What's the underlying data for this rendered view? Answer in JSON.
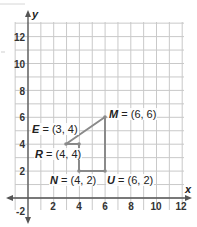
{
  "chart_data": {
    "type": "scatter",
    "title": "",
    "xlabel": "x",
    "ylabel": "y",
    "xlim": [
      -1,
      12.5
    ],
    "ylim": [
      -2.5,
      13
    ],
    "grid": true,
    "x_ticks": [
      "2",
      "4",
      "6",
      "8",
      "10",
      "12"
    ],
    "y_ticks": [
      "12",
      "10",
      "8",
      "6",
      "4",
      "2",
      "-2"
    ],
    "points": [
      {
        "name": "E",
        "x": 3,
        "y": 4,
        "label": "E = (3, 4)"
      },
      {
        "name": "M",
        "x": 6,
        "y": 6,
        "label": "M = (6, 6)"
      },
      {
        "name": "U",
        "x": 6,
        "y": 2,
        "label": "U = (6, 2)"
      },
      {
        "name": "N",
        "x": 4,
        "y": 2,
        "label": "N = (4, 2)"
      },
      {
        "name": "R",
        "x": 4,
        "y": 4,
        "label": "R = (4, 4)"
      }
    ],
    "polygon_order": [
      "E",
      "M",
      "U",
      "N",
      "R",
      "E"
    ],
    "colors": {
      "polygon": "#8a8a8a",
      "grid": "#c8c8c8",
      "axis": "#555555"
    }
  },
  "labels": {
    "E": {
      "name": "E",
      "coords": "= (3, 4)"
    },
    "M": {
      "name": "M",
      "coords": "= (6, 6)"
    },
    "U": {
      "name": "U",
      "coords": "= (6, 2)"
    },
    "N": {
      "name": "N",
      "coords": "= (4, 2)"
    },
    "R": {
      "name": "R",
      "coords": "= (4, 4)"
    }
  },
  "axes": {
    "x_name": "x",
    "y_name": "y"
  },
  "ticks": {
    "x": [
      "2",
      "4",
      "6",
      "8",
      "10",
      "12"
    ],
    "y": [
      "12",
      "10",
      "8",
      "6",
      "4",
      "2",
      "-2"
    ]
  }
}
